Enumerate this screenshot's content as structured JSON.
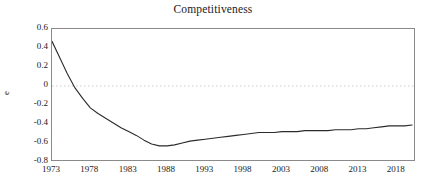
{
  "chart_data": {
    "type": "line",
    "title": "Competitiveness",
    "xlabel": "",
    "ylabel": "e",
    "xlim": [
      1973,
      2020.5
    ],
    "ylim": [
      -0.8,
      0.6
    ],
    "ytick_labels": [
      "0.6",
      "0.4",
      "0.2",
      "0",
      "-0.2",
      "-0.4",
      "-0.6",
      "-0.8"
    ],
    "ytick_values": [
      0.6,
      0.4,
      0.2,
      0,
      -0.2,
      -0.4,
      -0.6,
      -0.8
    ],
    "xtick_labels": [
      "1973",
      "1978",
      "1983",
      "1988",
      "1993",
      "1998",
      "2003",
      "2008",
      "2013",
      "2018"
    ],
    "xtick_values": [
      1973,
      1978,
      1983,
      1988,
      1993,
      1998,
      2003,
      2008,
      2013,
      2018
    ],
    "grid": false,
    "legend": "none",
    "zero_line": {
      "value": 0,
      "style": "dotted",
      "color": "#c8c8c8"
    },
    "line_color": "#2b2b2b",
    "series": [
      {
        "name": "e",
        "x": [
          1973,
          1974,
          1975,
          1976,
          1977,
          1978,
          1979,
          1980,
          1981,
          1982,
          1983,
          1984,
          1985,
          1986,
          1987,
          1988,
          1989,
          1990,
          1991,
          1992,
          1993,
          1994,
          1995,
          1996,
          1997,
          1998,
          1999,
          2000,
          2001,
          2002,
          2003,
          2004,
          2005,
          2006,
          2007,
          2008,
          2009,
          2010,
          2011,
          2012,
          2013,
          2014,
          2015,
          2016,
          2017,
          2018,
          2019,
          2020
        ],
        "values": [
          0.47,
          0.3,
          0.13,
          -0.02,
          -0.13,
          -0.23,
          -0.29,
          -0.34,
          -0.39,
          -0.44,
          -0.48,
          -0.52,
          -0.57,
          -0.61,
          -0.63,
          -0.63,
          -0.62,
          -0.6,
          -0.58,
          -0.57,
          -0.56,
          -0.55,
          -0.54,
          -0.53,
          -0.52,
          -0.51,
          -0.5,
          -0.49,
          -0.49,
          -0.49,
          -0.48,
          -0.48,
          -0.48,
          -0.47,
          -0.47,
          -0.47,
          -0.47,
          -0.46,
          -0.46,
          -0.46,
          -0.45,
          -0.45,
          -0.44,
          -0.43,
          -0.42,
          -0.42,
          -0.42,
          -0.41
        ]
      }
    ]
  }
}
